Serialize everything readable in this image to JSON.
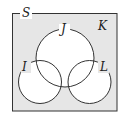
{
  "diagram": {
    "type": "venn",
    "universe_label": "S",
    "region_label": "K",
    "sets": [
      {
        "name": "J",
        "label": "J"
      },
      {
        "name": "I",
        "label": "I"
      },
      {
        "name": "L",
        "label": "L"
      }
    ],
    "relations": [
      "I overlaps J",
      "L overlaps J",
      "I and L do not overlap"
    ],
    "colors": {
      "background": "#e6e6e6",
      "circle_fill": "#ffffff",
      "stroke": "#333333"
    }
  }
}
